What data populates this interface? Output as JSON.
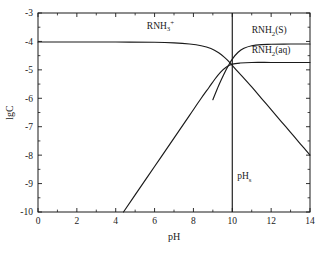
{
  "chart_data": {
    "type": "line",
    "title": "",
    "xlabel": "pH",
    "ylabel": "lgC",
    "xlim": [
      0,
      14
    ],
    "ylim": [
      -10,
      -3
    ],
    "grid": false,
    "legend_position": "inline-annotations",
    "x_major_ticks": [
      0,
      2,
      4,
      6,
      8,
      10,
      12,
      14
    ],
    "x_major_tick_labels": [
      "0",
      "2",
      "4",
      "6",
      "8",
      "10",
      "12",
      "14"
    ],
    "x_minor_tick_interval": 1,
    "y_major_ticks": [
      -3,
      -4,
      -5,
      -6,
      -7,
      -8,
      -9,
      -10
    ],
    "y_major_tick_labels": [
      "-3",
      "-4",
      "-5",
      "-6",
      "-7",
      "-8",
      "-9",
      "-10"
    ],
    "y_minor_tick_interval": 0.5,
    "series": [
      {
        "name": "RNH3+",
        "label": "RNH",
        "label_sub": "3",
        "label_sup": "+",
        "points": [
          [
            0.0,
            -4.02
          ],
          [
            2.0,
            -4.02
          ],
          [
            4.0,
            -4.02
          ],
          [
            6.0,
            -4.03
          ],
          [
            7.0,
            -4.05
          ],
          [
            7.8,
            -4.09
          ],
          [
            8.4,
            -4.15
          ],
          [
            8.9,
            -4.25
          ],
          [
            9.3,
            -4.4
          ],
          [
            9.6,
            -4.56
          ],
          [
            9.9,
            -4.76
          ],
          [
            10.1,
            -4.92
          ],
          [
            10.5,
            -5.22
          ],
          [
            11.0,
            -5.6
          ],
          [
            11.5,
            -6.0
          ],
          [
            12.0,
            -6.4
          ],
          [
            12.5,
            -6.8
          ],
          [
            13.0,
            -7.2
          ],
          [
            13.5,
            -7.6
          ],
          [
            14.0,
            -8.0
          ]
        ]
      },
      {
        "name": "RNH2(S)",
        "label": "RNH",
        "label_sub": "2",
        "label_tail": "(S)",
        "points": [
          [
            9.0,
            -6.05
          ],
          [
            9.3,
            -5.55
          ],
          [
            9.55,
            -5.18
          ],
          [
            9.8,
            -4.85
          ],
          [
            10.0,
            -4.62
          ],
          [
            10.3,
            -4.38
          ],
          [
            10.6,
            -4.24
          ],
          [
            11.0,
            -4.15
          ],
          [
            11.5,
            -4.11
          ],
          [
            12.0,
            -4.1
          ],
          [
            13.0,
            -4.09
          ],
          [
            14.0,
            -4.09
          ]
        ]
      },
      {
        "name": "RNH2(aq)",
        "label": "RNH",
        "label_sub": "2",
        "label_tail": "(aq)",
        "points": [
          [
            4.4,
            -10.0
          ],
          [
            5.0,
            -9.4
          ],
          [
            6.0,
            -8.4
          ],
          [
            7.0,
            -7.4
          ],
          [
            7.8,
            -6.6
          ],
          [
            8.4,
            -6.0
          ],
          [
            8.8,
            -5.62
          ],
          [
            9.1,
            -5.33
          ],
          [
            9.4,
            -5.08
          ],
          [
            9.7,
            -4.9
          ],
          [
            10.0,
            -4.8
          ],
          [
            10.4,
            -4.76
          ],
          [
            11.0,
            -4.74
          ],
          [
            12.0,
            -4.74
          ],
          [
            13.0,
            -4.74
          ],
          [
            14.0,
            -4.74
          ]
        ]
      }
    ],
    "annotations": [
      {
        "name": "phs-vertical-line",
        "type": "vline",
        "x": 10.0,
        "y_from": -3.0,
        "y_to": -10.0,
        "label": "pH",
        "label_sub": "s",
        "label_x": 10.25,
        "label_y": -8.85
      }
    ],
    "curve_label_positions": [
      {
        "series": "RNH3+",
        "x": 5.6,
        "y": -3.55
      },
      {
        "series": "RNH2(S)",
        "x": 11.0,
        "y": -3.72
      },
      {
        "series": "RNH2(aq)",
        "x": 11.0,
        "y": -4.42
      }
    ],
    "colors": {
      "axis": "#1a1a1a",
      "curve": "#1a1a1a",
      "background": "#ffffff"
    }
  }
}
